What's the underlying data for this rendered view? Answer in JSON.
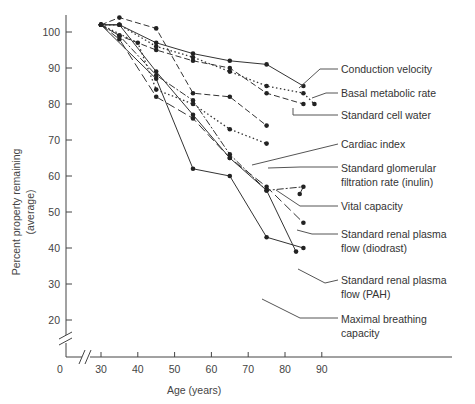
{
  "chart_data": {
    "type": "line",
    "title": "",
    "xlabel": "Age (years)",
    "ylabel": "Percent property remaining (average)",
    "ylabel_lines": [
      "Percent property remaining",
      "(average)"
    ],
    "x_ticks": [
      0,
      30,
      40,
      50,
      60,
      70,
      80,
      90
    ],
    "y_ticks": [
      20,
      30,
      40,
      50,
      60,
      70,
      80,
      90,
      100
    ],
    "xlim": [
      30,
      90
    ],
    "ylim": [
      20,
      100
    ],
    "axis_breaks": {
      "x": true,
      "y": true
    },
    "grid": false,
    "legend_position": "right, with leader lines to series ends",
    "series": [
      {
        "name": "Conduction velocity",
        "style": "solid",
        "x": [
          30,
          35,
          45,
          55,
          65,
          75,
          85
        ],
        "y": [
          102,
          102,
          97,
          94,
          92,
          91,
          85
        ]
      },
      {
        "name": "Basal metabolic rate",
        "style": "dotted",
        "x": [
          30,
          35,
          45,
          55,
          65,
          75,
          85,
          88
        ],
        "y": [
          102,
          102,
          96,
          93,
          89,
          85,
          83,
          80
        ]
      },
      {
        "name": "Standard cell water",
        "style": "dashed",
        "x": [
          30,
          35,
          45,
          55,
          65,
          75,
          85
        ],
        "y": [
          102,
          99,
          95,
          92,
          90,
          83,
          80
        ]
      },
      {
        "name": "Cardiac index",
        "style": "dashed",
        "x": [
          30,
          35,
          45,
          55,
          65,
          75
        ],
        "y": [
          102,
          104,
          101,
          83,
          82,
          74
        ]
      },
      {
        "name": "Standard glomerular filtration rate (inulin)",
        "style": "dash-dot",
        "x": [
          30,
          35,
          45,
          55,
          65,
          75,
          85,
          84
        ],
        "y": [
          102,
          99,
          88,
          81,
          66,
          56,
          57,
          55
        ]
      },
      {
        "name": "Vital capacity",
        "style": "dotted",
        "x": [
          30,
          40,
          45,
          55,
          65,
          75
        ],
        "y": [
          102,
          97,
          84,
          80,
          73,
          69
        ]
      },
      {
        "name": "Standard renal plasma flow (diodrast)",
        "style": "long-dash",
        "x": [
          30,
          35,
          45,
          55,
          65,
          75,
          85
        ],
        "y": [
          102,
          98,
          82,
          76,
          65,
          57,
          47
        ]
      },
      {
        "name": "Standard renal plasma flow (PAH)",
        "style": "solid",
        "x": [
          30,
          35,
          45,
          55,
          65,
          75,
          83
        ],
        "y": [
          102,
          102,
          89,
          77,
          65,
          56,
          39
        ]
      },
      {
        "name": "Maximal breathing capacity",
        "style": "solid",
        "x": [
          30,
          45,
          55,
          65,
          75,
          85
        ],
        "y": [
          102,
          87,
          62,
          60,
          43,
          40
        ]
      }
    ]
  },
  "legend": [
    {
      "lines": [
        "Conduction velocity"
      ]
    },
    {
      "lines": [
        "Basal metabolic rate"
      ]
    },
    {
      "lines": [
        "Standard cell water"
      ]
    },
    {
      "lines": [
        "Cardiac index"
      ]
    },
    {
      "lines": [
        "Standard glomerular",
        "filtration rate (inulin)"
      ]
    },
    {
      "lines": [
        "Vital capacity"
      ]
    },
    {
      "lines": [
        "Standard renal plasma",
        "flow (diodrast)"
      ]
    },
    {
      "lines": [
        "Standard renal plasma",
        "flow (PAH)"
      ]
    },
    {
      "lines": [
        "Maximal breathing",
        "capacity"
      ]
    }
  ]
}
